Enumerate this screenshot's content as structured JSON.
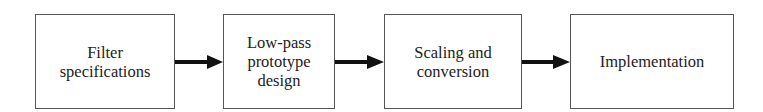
{
  "diagram": {
    "type": "flowchart",
    "direction": "left-to-right",
    "blocks": [
      {
        "id": "filter-specifications",
        "label": "Filter\nspecifications"
      },
      {
        "id": "low-pass-prototype-design",
        "label": "Low-pass\nprototype\ndesign"
      },
      {
        "id": "scaling-and-conversion",
        "label": "Scaling and\nconversion"
      },
      {
        "id": "implementation",
        "label": "Implementation"
      }
    ],
    "edges": [
      {
        "from": "filter-specifications",
        "to": "low-pass-prototype-design"
      },
      {
        "from": "low-pass-prototype-design",
        "to": "scaling-and-conversion"
      },
      {
        "from": "scaling-and-conversion",
        "to": "implementation"
      }
    ],
    "colors": {
      "stroke": "#555555",
      "arrow": "#111111",
      "text": "#222222",
      "background": "#ffffff"
    }
  }
}
